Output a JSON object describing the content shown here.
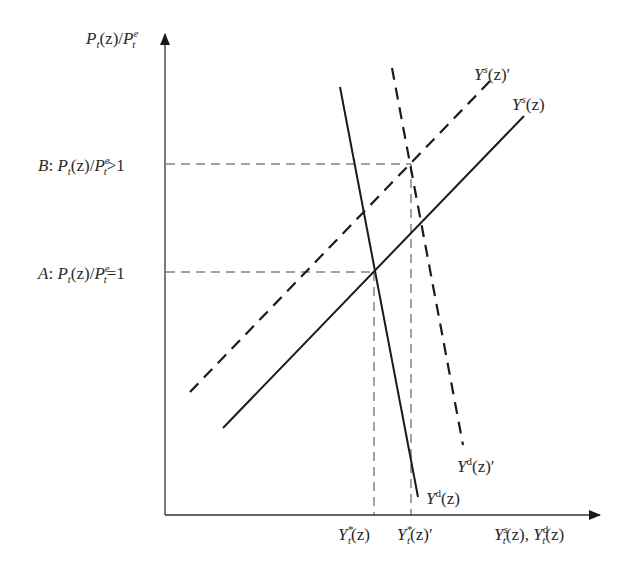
{
  "diagram": {
    "type": "supply-demand",
    "y_axis": {
      "label_html": "P<sub>t</sub>(z)/P<sup>e</sup><sub>t</sub>",
      "label_text": "Pt(z)/Pt^e"
    },
    "x_axis": {
      "label_text": "Yt^s(z), Yt^d(z)"
    },
    "levels": [
      {
        "id": "A",
        "prefix": "A",
        "text": "A: Pt(z)/Pt^e=1",
        "relation": "=1"
      },
      {
        "id": "B",
        "prefix": "B",
        "text": "B: Pt(z)/Pt^e>1",
        "relation": ">1"
      }
    ],
    "x_ticks": [
      {
        "text": "Yt*(z)"
      },
      {
        "text": "Yt*(z)'"
      }
    ],
    "curves": [
      {
        "name": "Ys(z)",
        "style": "solid",
        "x1": 223,
        "y1": 428,
        "x2": 524,
        "y2": 116
      },
      {
        "name": "Ys(z)'",
        "style": "dashed",
        "x1": 190,
        "y1": 392,
        "x2": 491,
        "y2": 80
      },
      {
        "name": "Yd(z)",
        "style": "solid",
        "x1": 340,
        "y1": 87,
        "x2": 418,
        "y2": 497
      },
      {
        "name": "Yd(z)'",
        "style": "dashed",
        "x1": 392,
        "y1": 68,
        "x2": 463,
        "y2": 445
      }
    ],
    "colors": {
      "line": "#1a1a1a",
      "axis": "#333333",
      "guide": "#444444"
    }
  },
  "labels": {
    "y_axis": "P",
    "level_B_prefix": "B",
    "level_A_prefix": "A",
    "ys_prime": "Y",
    "ys": "Y",
    "yd_prime": "Y",
    "yd": "Y",
    "tick_1": "Y",
    "tick_2": "Y",
    "x_axis": "Y"
  }
}
